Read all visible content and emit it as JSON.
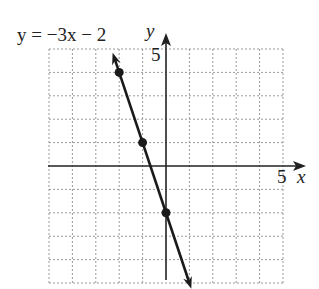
{
  "chart_data": {
    "type": "line",
    "equation": "y = -3x - 2",
    "xlabel": "x",
    "ylabel": "y",
    "xlim": [
      -5,
      5
    ],
    "ylim": [
      -5,
      5
    ],
    "grid": true,
    "grid_style": "dotted",
    "tick_labels": {
      "x": [
        "5"
      ],
      "y": [
        "5"
      ]
    },
    "line": {
      "slope": -3,
      "intercept": -2,
      "x_range": [
        -2.2,
        1
      ],
      "arrows": "both"
    },
    "points": [
      {
        "x": -2,
        "y": 4
      },
      {
        "x": -1,
        "y": 1
      },
      {
        "x": 0,
        "y": -2
      }
    ]
  },
  "labels": {
    "equation": "y = −3x − 2",
    "x_axis": "x",
    "y_axis": "y",
    "x_tick": "5",
    "y_tick": "5"
  },
  "colors": {
    "line": "#1a1a1a",
    "grid": "#9a9a9a",
    "axis": "#222222"
  }
}
